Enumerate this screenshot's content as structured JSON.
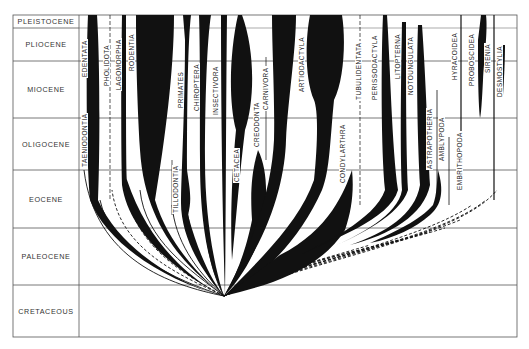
{
  "diagram": {
    "type": "phylogenetic-spindle-diagram",
    "epochs": [
      {
        "name": "PLEISTOCENE",
        "top": 15,
        "bottom": 28
      },
      {
        "name": "PLIOCENE",
        "top": 28,
        "bottom": 61
      },
      {
        "name": "MIOCENE",
        "top": 61,
        "bottom": 118
      },
      {
        "name": "OLIGOCENE",
        "top": 118,
        "bottom": 170
      },
      {
        "name": "EOCENE",
        "top": 170,
        "bottom": 228
      },
      {
        "name": "PALEOCENE",
        "top": 228,
        "bottom": 285
      },
      {
        "name": "CRETACEOUS",
        "top": 285,
        "bottom": 337
      }
    ],
    "taxa": [
      {
        "name": "TAENIODONTIA",
        "x": 86,
        "y": 168
      },
      {
        "name": "EDENTATA",
        "x": 86,
        "y": 78
      },
      {
        "name": "PHOLIDOTA",
        "x": 111,
        "y": 87
      },
      {
        "name": "LAGOMORPHA",
        "x": 121,
        "y": 91
      },
      {
        "name": "RODENTIA",
        "x": 134,
        "y": 72
      },
      {
        "name": "TILLODONTIA",
        "x": 178,
        "y": 214
      },
      {
        "name": "PRIMATES",
        "x": 182,
        "y": 109
      },
      {
        "name": "CHIROPTERA",
        "x": 198,
        "y": 112
      },
      {
        "name": "INSECTIVORA",
        "x": 216,
        "y": 116
      },
      {
        "name": "CETACEA",
        "x": 238,
        "y": 183
      },
      {
        "name": "CREODONTA",
        "x": 256,
        "y": 148
      },
      {
        "name": "CARNIVORA",
        "x": 266,
        "y": 111
      },
      {
        "name": "ARTIODACTYLA",
        "x": 302,
        "y": 93
      },
      {
        "name": "CONDYLARTHRA",
        "x": 344,
        "y": 184
      },
      {
        "name": "TUBULIDENTATA",
        "x": 360,
        "y": 101
      },
      {
        "name": "PERISSODACTYLA",
        "x": 376,
        "y": 101
      },
      {
        "name": "LITOPTERNA",
        "x": 398,
        "y": 80
      },
      {
        "name": "NOTOUNGULATA",
        "x": 411,
        "y": 96
      },
      {
        "name": "ASTRAPOTHERIA",
        "x": 431,
        "y": 170
      },
      {
        "name": "AMBLYPODA",
        "x": 441,
        "y": 162
      },
      {
        "name": "EMBRITHOPODA",
        "x": 461,
        "y": 191
      },
      {
        "name": "HYRACOIDEA",
        "x": 454,
        "y": 81
      },
      {
        "name": "PROBOSCIDEA",
        "x": 473,
        "y": 87
      },
      {
        "name": "SIRENIA",
        "x": 488,
        "y": 74
      },
      {
        "name": "DESMOSTYLIA",
        "x": 498,
        "y": 98
      }
    ],
    "colors": {
      "ink": "#111111",
      "grid": "#555555",
      "text": "#333333",
      "background": "#ffffff"
    },
    "origin_point": {
      "x": 224,
      "y": 296
    }
  }
}
